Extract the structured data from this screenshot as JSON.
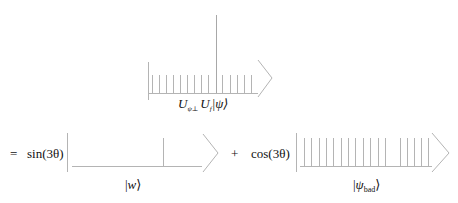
{
  "colors": {
    "stroke": "#b4b4b4",
    "tall_bar": "#a8a8a8",
    "text": "#111111",
    "background": "#ffffff"
  },
  "top_diagram": {
    "label": {
      "U1": "U",
      "sub1": "ψ⊥",
      "U2": "U",
      "sub2": "f",
      "ket": "|ψ⟩"
    },
    "left_border": {
      "x": 148,
      "y1": 62,
      "y2": 100
    },
    "baseline": {
      "y": 93,
      "x1": 148,
      "x2": 258
    },
    "tick_top": 75,
    "ticks_x": [
      152,
      159,
      166,
      173,
      180,
      187,
      194,
      201,
      208,
      222,
      230,
      237,
      244,
      251
    ],
    "tall_bar": {
      "x": 216,
      "y1": 15,
      "y2": 93
    },
    "arrow": {
      "x": 258,
      "y_top": 60,
      "tip_x": 272,
      "tip_y": 78,
      "y_bot": 97
    }
  },
  "equation": {
    "equals": "=",
    "sin_term": "sin(3θ)",
    "plus": "+",
    "cos_term": "cos(3θ)"
  },
  "bottom_left_diagram": {
    "label": {
      "ket_open": "|",
      "var": "w",
      "ket_close": "⟩"
    },
    "left_border": {
      "x": 67,
      "y1": 133,
      "y2": 172
    },
    "baseline": {
      "y": 166,
      "x1": 72,
      "x2": 202
    },
    "bars_x": [
      163
    ],
    "bar_top": 138,
    "arrow": {
      "x": 203,
      "y_top": 134,
      "tip_x": 218,
      "tip_y": 153,
      "y_bot": 172
    }
  },
  "bottom_right_diagram": {
    "label": {
      "ket_open": "|",
      "var": "ψ",
      "sub": "bad",
      "ket_close": "⟩"
    },
    "left_border": {
      "x": 296,
      "y1": 133,
      "y2": 172
    },
    "baseline": {
      "y": 166,
      "x1": 300,
      "x2": 432
    },
    "bars_x": [
      304,
      311,
      319,
      326,
      333,
      341,
      348,
      355,
      363,
      370,
      378,
      385,
      400,
      407,
      414,
      421,
      428
    ],
    "bar_top": 138,
    "arrow": {
      "x": 432,
      "y_top": 133,
      "tip_x": 449,
      "tip_y": 153,
      "y_bot": 172
    }
  }
}
